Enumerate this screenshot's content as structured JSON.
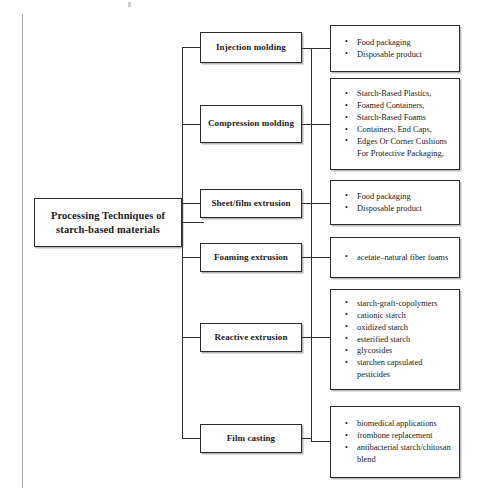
{
  "diagram": {
    "type": "tree",
    "title": "Processing Techniques of starch-based materials",
    "root": {
      "name": "root-node",
      "label": "Processing Techniques of starch-based materials"
    },
    "techniques": [
      {
        "name": "injection-molding",
        "label": "Injection molding",
        "outputs": [
          "Food packaging",
          "Disposable product"
        ]
      },
      {
        "name": "compression-molding",
        "label": "Compression molding",
        "outputs": [
          "Starch-Based Plastics,",
          "Foamed Containers,",
          "Starch-Based Foams",
          "Containers, End Caps,",
          "Edges Or Corner Cushions For Protective Packaging,"
        ]
      },
      {
        "name": "sheet-film-extrusion",
        "label": "Sheet/film extrusion",
        "outputs": [
          "Food packaging",
          "Disposable product"
        ]
      },
      {
        "name": "foaming-extrusion",
        "label": "Foaming extrusion",
        "outputs": [
          "acetate–natural fiber foams"
        ]
      },
      {
        "name": "reactive-extrusion",
        "label": "Reactive extrusion",
        "outputs": [
          "starch-graft-copolymers",
          "cationic starch",
          "oxidized starch",
          "esterified starch",
          "glycosides",
          "starchen capsulated pesticides"
        ]
      },
      {
        "name": "film-casting",
        "label": "Film casting",
        "outputs": [
          "biomedical applications",
          "frombone replacement",
          "antibacterial starch/chitosan blend"
        ]
      }
    ],
    "colors": {
      "ink": "#2b2b2b",
      "page": "#ffffff",
      "connector": "#2f2f2f",
      "scan_artifact": "#9a9a9a"
    }
  }
}
